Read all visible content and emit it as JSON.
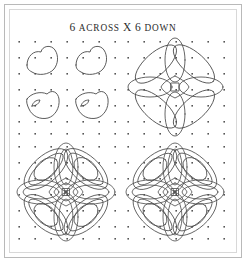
{
  "figure": {
    "title_prefix": "6",
    "title_word1": "ACROSS",
    "title_mid": "X",
    "title_suffix": "6",
    "title_word2": "DOWN",
    "title_full": "6 ACROSS X 6 DOWN",
    "grid_across": 6,
    "grid_down": 6,
    "dot_color": "#555555",
    "line_color": "#4a4a4a",
    "background_color": "#ffffff",
    "frame_color": "#b9b9b9"
  },
  "panels": [
    {
      "id": "panel-top-left",
      "stage": 1,
      "caption": "",
      "description": "four separate leaf outlines on dot grid",
      "motifs": 4,
      "overlapping": false,
      "interlaced": false
    },
    {
      "id": "panel-top-right",
      "stage": 2,
      "caption": "",
      "description": "overlapping leaf outlines forming rosette",
      "motifs": 8,
      "overlapping": true,
      "interlaced": false
    },
    {
      "id": "panel-bottom-left",
      "stage": 3,
      "caption": "",
      "description": "interlaced doubled-band celtic knot",
      "motifs": 8,
      "overlapping": true,
      "interlaced": true
    },
    {
      "id": "panel-bottom-right",
      "stage": 4,
      "caption": "",
      "description": "finished interlaced celtic knot",
      "motifs": 8,
      "overlapping": true,
      "interlaced": true
    }
  ]
}
